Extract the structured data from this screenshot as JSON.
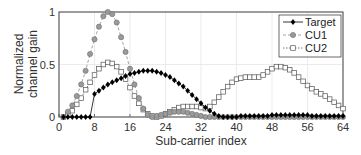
{
  "chart_data": {
    "type": "line",
    "title": "",
    "xlabel": "Sub-carrier index",
    "ylabel": "Normalized channel gain",
    "ylabel_lines": [
      "Normalized",
      "channel gain"
    ],
    "xlim": [
      0,
      64
    ],
    "ylim": [
      0,
      1
    ],
    "xticks": [
      "0",
      "8",
      "16",
      "24",
      "32",
      "40",
      "48",
      "56",
      "64"
    ],
    "yticks": [
      "0",
      "0.5",
      "1"
    ],
    "grid": true,
    "legend_position": "upper right",
    "x": [
      1,
      2,
      3,
      4,
      5,
      6,
      7,
      8,
      9,
      10,
      11,
      12,
      13,
      14,
      15,
      16,
      17,
      18,
      19,
      20,
      21,
      22,
      23,
      24,
      25,
      26,
      27,
      28,
      29,
      30,
      31,
      32,
      33,
      34,
      35,
      36,
      37,
      38,
      39,
      40,
      41,
      42,
      43,
      44,
      45,
      46,
      47,
      48,
      49,
      50,
      51,
      52,
      53,
      54,
      55,
      56,
      57,
      58,
      59,
      60,
      61,
      62,
      63,
      64
    ],
    "series": [
      {
        "name": "Target",
        "marker": "diamond-filled",
        "color": "#000000",
        "values": [
          0,
          0,
          0,
          0,
          0,
          0,
          0,
          0.22,
          0.25,
          0.28,
          0.31,
          0.33,
          0.35,
          0.37,
          0.39,
          0.41,
          0.42,
          0.43,
          0.44,
          0.44,
          0.44,
          0.43,
          0.42,
          0.4,
          0.38,
          0.35,
          0.32,
          0.29,
          0.25,
          0.21,
          0.17,
          0.13,
          0.09,
          0.06,
          0.03,
          0.01,
          0,
          0,
          0,
          0,
          0.01,
          0.01,
          0.01,
          0.01,
          0.01,
          0.01,
          0.01,
          0.02,
          0.02,
          0.02,
          0.02,
          0.02,
          0.02,
          0.02,
          0.02,
          0.02,
          0.01,
          0.01,
          0.01,
          0.01,
          0.01,
          0.01,
          0.01,
          0.01
        ]
      },
      {
        "name": "CU1",
        "marker": "circle-gray",
        "color": "#8c8c8c",
        "values": [
          0,
          0.05,
          0.11,
          0.2,
          0.31,
          0.44,
          0.6,
          0.74,
          0.86,
          0.96,
          1.0,
          0.98,
          0.9,
          0.76,
          0.62,
          0.46,
          0.31,
          0.18,
          0.08,
          0.02,
          0,
          0.01,
          0.02,
          0.03,
          0.04,
          0.05,
          0.05,
          0.05,
          0.04,
          0.03,
          0.02,
          0.01,
          0,
          0,
          0,
          0,
          0,
          0,
          0,
          0,
          0,
          0,
          0,
          0,
          0,
          0,
          0,
          0,
          0,
          0,
          0,
          0,
          0,
          0,
          0,
          0,
          0,
          0,
          0,
          0,
          0,
          0,
          0,
          0
        ]
      },
      {
        "name": "CU2",
        "marker": "square-open",
        "color": "#555555",
        "values": [
          0,
          0.02,
          0.06,
          0.12,
          0.18,
          0.26,
          0.33,
          0.4,
          0.46,
          0.5,
          0.52,
          0.51,
          0.48,
          0.43,
          0.36,
          0.28,
          0.2,
          0.13,
          0.07,
          0.03,
          0.01,
          0,
          0.01,
          0.03,
          0.05,
          0.07,
          0.09,
          0.1,
          0.1,
          0.1,
          0.1,
          0.09,
          0.08,
          0.1,
          0.14,
          0.19,
          0.24,
          0.29,
          0.33,
          0.36,
          0.37,
          0.38,
          0.38,
          0.38,
          0.38,
          0.4,
          0.43,
          0.46,
          0.48,
          0.48,
          0.47,
          0.45,
          0.42,
          0.38,
          0.34,
          0.3,
          0.27,
          0.24,
          0.22,
          0.2,
          0.17,
          0.14,
          0.11,
          0.08
        ]
      }
    ]
  }
}
